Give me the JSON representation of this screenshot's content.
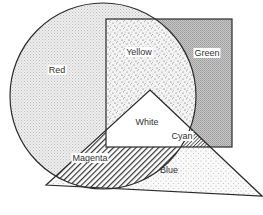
{
  "diagram": {
    "type": "subtractive-color-venn",
    "shapes": [
      {
        "id": "circle",
        "color_name": "Red",
        "kind": "circle",
        "cx": 103,
        "cy": 96,
        "r": 93
      },
      {
        "id": "rectangle",
        "color_name": "Green",
        "kind": "rect",
        "x": 106,
        "y": 19,
        "w": 126,
        "h": 128
      },
      {
        "id": "triangle",
        "color_name": "Blue",
        "kind": "polygon",
        "points": "150,90 262,196 46,185"
      }
    ],
    "regions": [
      {
        "name": "Red",
        "label": "Red",
        "x": 57,
        "y": 70,
        "pattern": "fine-dots-light"
      },
      {
        "name": "Yellow",
        "label": "Yellow",
        "x": 139,
        "y": 52,
        "pattern": "speckle"
      },
      {
        "name": "Green",
        "label": "Green",
        "x": 207,
        "y": 53,
        "pattern": "grey-dither"
      },
      {
        "name": "White",
        "label": "White",
        "x": 147,
        "y": 122,
        "pattern": "none"
      },
      {
        "name": "Cyan",
        "label": "Cyan",
        "x": 182,
        "y": 136,
        "pattern": "hatch-dense"
      },
      {
        "name": "Magenta",
        "label": "Magenta",
        "x": 90,
        "y": 158,
        "pattern": "hatch"
      },
      {
        "name": "Blue",
        "label": "Blue",
        "x": 169,
        "y": 170,
        "pattern": "sparse-dots"
      }
    ],
    "colors": {
      "stroke": "#2b2b2b",
      "red_fill": "#e6e6e6",
      "yellow_fill": "#ececec",
      "green_fill": "#bdbdbd",
      "blue_fill": "#f3f3f3",
      "white_fill": "#ffffff",
      "text": "#333333",
      "background": "#ffffff"
    }
  }
}
